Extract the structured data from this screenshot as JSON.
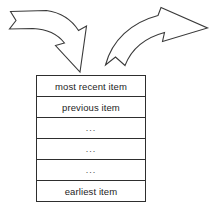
{
  "diagram": {
    "colors": {
      "stroke": "#2e2e2e",
      "arrow_stroke": "#3a3a3a",
      "text": "#1d1d1d",
      "background": "#ffffff"
    },
    "arrows": [
      {
        "name": "incoming-arrow",
        "direction": "down-right",
        "style": "curved ribbon outline arrow",
        "points_to": "top of item stack"
      },
      {
        "name": "outgoing-arrow",
        "direction": "up-right",
        "style": "curved ribbon outline arrow",
        "points_to": "away to the right"
      }
    ],
    "stack": {
      "name": "item-stack",
      "rows": [
        {
          "label": "most recent item",
          "kind": "text"
        },
        {
          "label": "previous item",
          "kind": "text"
        },
        {
          "label": "...",
          "kind": "ellipsis"
        },
        {
          "label": "...",
          "kind": "ellipsis"
        },
        {
          "label": "...",
          "kind": "ellipsis"
        },
        {
          "label": "earliest item",
          "kind": "text"
        }
      ]
    }
  }
}
